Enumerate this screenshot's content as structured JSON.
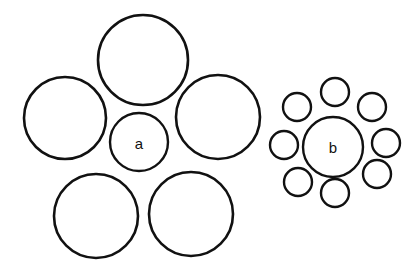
{
  "figure": {
    "name": "ebbinghaus-illusion",
    "background_color": "#ffffff",
    "stroke_color": "#111111",
    "canvas": {
      "width": 412,
      "height": 275
    }
  },
  "chart_data": {
    "type": "diagram",
    "units": "pixels",
    "groups": [
      {
        "id": "group-a",
        "label": "a",
        "label_position": {
          "x": 139,
          "y": 142
        },
        "target": {
          "id": "target-a",
          "label": "a",
          "cx": 139,
          "cy": 142,
          "r": 29,
          "stroke_width": 2.4
        },
        "inducers": [
          {
            "id": "inducer-a-top",
            "cx": 143,
            "cy": 60,
            "r": 45,
            "stroke_width": 2.6
          },
          {
            "id": "inducer-a-left",
            "cx": 65,
            "cy": 118,
            "r": 41,
            "stroke_width": 2.6
          },
          {
            "id": "inducer-a-right",
            "cx": 218,
            "cy": 117,
            "r": 42,
            "stroke_width": 2.6
          },
          {
            "id": "inducer-a-bottom-left",
            "cx": 96,
            "cy": 216,
            "r": 42,
            "stroke_width": 2.6
          },
          {
            "id": "inducer-a-bottom-right",
            "cx": 191,
            "cy": 214,
            "r": 42,
            "stroke_width": 2.6
          }
        ]
      },
      {
        "id": "group-b",
        "label": "b",
        "label_position": {
          "x": 333,
          "y": 147
        },
        "target": {
          "id": "target-b",
          "label": "b",
          "cx": 333,
          "cy": 147,
          "r": 30,
          "stroke_width": 2.4
        },
        "inducers": [
          {
            "id": "inducer-b-top",
            "cx": 335,
            "cy": 92,
            "r": 14,
            "stroke_width": 2.4
          },
          {
            "id": "inducer-b-top-left",
            "cx": 297,
            "cy": 107,
            "r": 14,
            "stroke_width": 2.4
          },
          {
            "id": "inducer-b-top-right",
            "cx": 372,
            "cy": 107,
            "r": 14,
            "stroke_width": 2.4
          },
          {
            "id": "inducer-b-left",
            "cx": 284,
            "cy": 145,
            "r": 14,
            "stroke_width": 2.4
          },
          {
            "id": "inducer-b-right",
            "cx": 386,
            "cy": 143,
            "r": 14,
            "stroke_width": 2.4
          },
          {
            "id": "inducer-b-bottom-left",
            "cx": 298,
            "cy": 182,
            "r": 14,
            "stroke_width": 2.4
          },
          {
            "id": "inducer-b-bottom-right",
            "cx": 377,
            "cy": 174,
            "r": 14,
            "stroke_width": 2.4
          },
          {
            "id": "inducer-b-bottom",
            "cx": 335,
            "cy": 193,
            "r": 14,
            "stroke_width": 2.4
          }
        ]
      }
    ],
    "labels": [
      {
        "text": "a",
        "x": 139,
        "y": 143,
        "font_size": 15
      },
      {
        "text": "b",
        "x": 333,
        "y": 147,
        "font_size": 15
      }
    ]
  }
}
